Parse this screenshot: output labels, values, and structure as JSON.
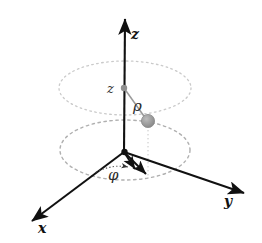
{
  "figure": {
    "background_color": "#ffffff",
    "width": 262,
    "height": 243
  },
  "colors": {
    "axis": "#111111",
    "label": "#111111",
    "coord_label": "#2b2b2b",
    "ellipse_upper": "#c9c9c9",
    "ellipse_lower": "#b4b4b4",
    "point_fill": "#9c9c9c",
    "point_stroke": "#7a7a7a",
    "helper_line": "#9a9a9a",
    "drop_line": "#c0c0c0",
    "arc": "#555555"
  },
  "axes": [
    {
      "name": "z-axis",
      "label": "z",
      "label_x": 133,
      "label_y": 38,
      "from": {
        "x": 124,
        "y": 152
      },
      "to": {
        "x": 125,
        "y": 15
      },
      "arrow": true
    },
    {
      "name": "y-axis",
      "label": "y",
      "label_x": 226,
      "label_y": 205,
      "from": {
        "x": 124,
        "y": 152
      },
      "to": {
        "x": 246,
        "y": 194
      },
      "arrow": true
    },
    {
      "name": "x-axis",
      "label": "x",
      "label_x": 39,
      "label_y": 232,
      "from": {
        "x": 124,
        "y": 152
      },
      "to": {
        "x": 30,
        "y": 223
      },
      "arrow": true
    }
  ],
  "ellipses": [
    {
      "name": "upper-dashed-ellipse",
      "cx": 125,
      "cy": 88,
      "rx": 66,
      "ry": 27,
      "style": "dotted"
    },
    {
      "name": "lower-dashed-ellipse",
      "cx": 125,
      "cy": 150,
      "rx": 65,
      "ry": 30,
      "style": "dashed"
    }
  ],
  "point": {
    "name": "coordinate-point",
    "x": 148,
    "y": 121,
    "radius": 6.5
  },
  "axis_marker": {
    "name": "z-height-marker",
    "x": 124,
    "y": 88,
    "radius": 3
  },
  "labels": {
    "z_height": {
      "text": "z",
      "x": 110,
      "y": 93,
      "size": 13
    },
    "rho": {
      "text": "ρ",
      "x": 134,
      "y": 110,
      "size": 14
    },
    "phi": {
      "text": "φ",
      "x": 110,
      "y": 179,
      "size": 14
    }
  },
  "helper_lines": [
    {
      "name": "rho-segment",
      "from": {
        "x": 124,
        "y": 88
      },
      "to": {
        "x": 146,
        "y": 119
      }
    },
    {
      "name": "point-drop-line",
      "from": {
        "x": 148,
        "y": 127
      },
      "to": {
        "x": 148,
        "y": 176
      }
    },
    {
      "name": "radial-projection-arrow",
      "from": {
        "x": 124,
        "y": 152
      },
      "to": {
        "x": 149,
        "y": 178
      }
    },
    {
      "name": "phi-reference-arrow",
      "from": {
        "x": 124,
        "y": 152
      },
      "to": {
        "x": 137,
        "y": 172
      }
    },
    {
      "name": "phi-arc-arrow",
      "from": {
        "x": 97,
        "y": 168
      },
      "to": {
        "x": 131,
        "y": 168
      }
    }
  ],
  "legend": {
    "description": "Cylindrical coordinates: radial distance rho, azimuth phi, height z"
  }
}
